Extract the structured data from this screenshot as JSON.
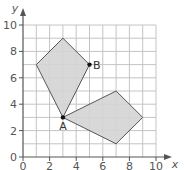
{
  "figure": {
    "x_axis_label": "x",
    "y_axis_label": "y",
    "x_ticks": [
      "0",
      "2",
      "4",
      "6",
      "8",
      "10"
    ],
    "y_ticks": [
      "0",
      "2",
      "4",
      "6",
      "8",
      "10"
    ],
    "points": [
      {
        "name": "A",
        "x": 3,
        "y": 3
      },
      {
        "name": "B",
        "x": 5,
        "y": 7
      }
    ],
    "shapes": [
      {
        "name": "kite-upper",
        "vertices": [
          [
            3,
            3
          ],
          [
            1,
            7
          ],
          [
            3,
            9
          ],
          [
            5,
            7
          ]
        ]
      },
      {
        "name": "kite-lower",
        "vertices": [
          [
            3,
            3
          ],
          [
            7,
            5
          ],
          [
            9,
            3
          ],
          [
            7,
            1
          ]
        ]
      }
    ],
    "colors": {
      "grid": "#bdbdbd",
      "axis": "#555555",
      "fill": "#d6d6d6",
      "stroke": "#555555",
      "point": "#111111"
    }
  }
}
